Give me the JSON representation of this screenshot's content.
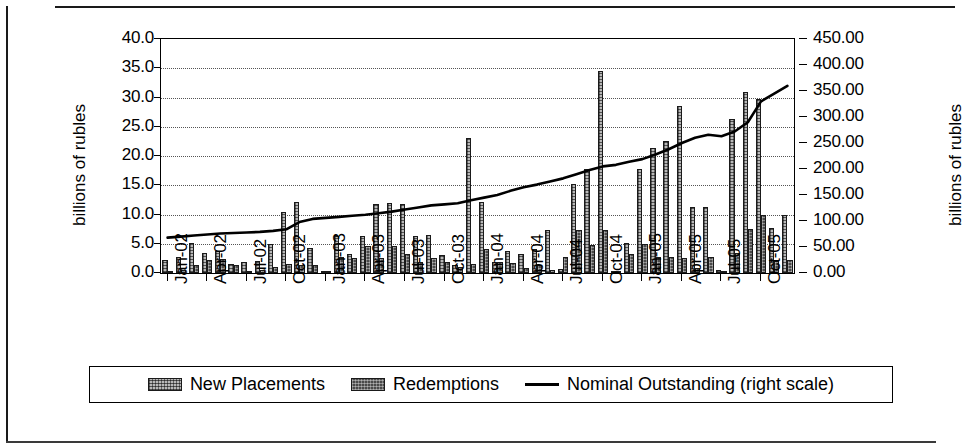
{
  "chart_data": {
    "type": "bar",
    "title": "",
    "subtitle": "",
    "xlabel": "",
    "ylabel": "billions of rubles",
    "ylabel_right": "billions of rubles",
    "ylim": [
      0,
      40
    ],
    "ylim_right": [
      0,
      450
    ],
    "ytick_step": 5,
    "ytick_step_right": 50,
    "grid": true,
    "legend_position": "bottom",
    "y_ticks_left": [
      "0.0",
      "5.0",
      "10.0",
      "15.0",
      "20.0",
      "25.0",
      "30.0",
      "35.0",
      "40.0"
    ],
    "y_ticks_right": [
      "0.00",
      "50.00",
      "100.00",
      "150.00",
      "200.00",
      "250.00",
      "300.00",
      "350.00",
      "400.00",
      "450.00"
    ],
    "x_tick_labels": [
      "Jan-02",
      "Apr-02",
      "Jul-02",
      "Oct-02",
      "Jan-03",
      "Apr-03",
      "Jul-03",
      "Oct-03",
      "Jan-04",
      "Apr-04",
      "Jul-04",
      "Oct-04",
      "Jan-05",
      "Apr-05",
      "Jul-05",
      "Oct-05"
    ],
    "x_tick_indices": [
      0,
      3,
      6,
      9,
      12,
      15,
      18,
      21,
      24,
      27,
      30,
      33,
      36,
      39,
      42,
      45
    ],
    "categories": [
      "Jan-02",
      "Feb-02",
      "Mar-02",
      "Apr-02",
      "May-02",
      "Jun-02",
      "Jul-02",
      "Aug-02",
      "Sep-02",
      "Oct-02",
      "Nov-02",
      "Dec-02",
      "Jan-03",
      "Feb-03",
      "Mar-03",
      "Apr-03",
      "May-03",
      "Jun-03",
      "Jul-03",
      "Aug-03",
      "Sep-03",
      "Oct-03",
      "Nov-03",
      "Dec-03",
      "Jan-04",
      "Feb-04",
      "Mar-04",
      "Apr-04",
      "May-04",
      "Jun-04",
      "Jul-04",
      "Aug-04",
      "Sep-04",
      "Oct-04",
      "Nov-04",
      "Dec-04",
      "Jan-05",
      "Feb-05",
      "Mar-05",
      "Apr-05",
      "May-05",
      "Jun-05",
      "Jul-05",
      "Aug-05",
      "Sep-05",
      "Oct-05",
      "Nov-05",
      "Dec-05"
    ],
    "series": [
      {
        "name": "New Placements",
        "axis": "left",
        "style": "bar-light-hatched",
        "values": [
          2.3,
          2.8,
          5.1,
          3.4,
          3.7,
          1.6,
          1.8,
          2.1,
          5.0,
          10.4,
          12.2,
          4.2,
          0.3,
          6.3,
          3.3,
          6.3,
          11.8,
          12.0,
          11.8,
          6.3,
          6.5,
          3.0,
          1.4,
          23.0,
          12.2,
          1.9,
          3.8,
          3.2,
          4.1,
          7.3,
          0.7,
          15.3,
          17.7,
          34.5,
          0.4,
          5.2,
          17.7,
          21.3,
          22.5,
          28.6,
          11.2,
          11.2,
          0.6,
          26.3,
          31.0,
          29.8,
          7.7,
          10.0
        ]
      },
      {
        "name": "Redemptions",
        "axis": "left",
        "style": "bar-dark-hatched",
        "values": [
          0.4,
          0.5,
          1.4,
          2.2,
          2.4,
          1.4,
          0.4,
          0.5,
          1.0,
          1.5,
          1.3,
          1.4,
          0.2,
          2.8,
          2.5,
          4.6,
          2.6,
          4.6,
          3.2,
          1.9,
          2.6,
          1.8,
          1.1,
          1.6,
          4.1,
          1.8,
          1.7,
          0.9,
          1.4,
          0.5,
          2.7,
          7.3,
          4.8,
          7.3,
          0.2,
          3.2,
          4.9,
          2.8,
          2.7,
          2.5,
          0.8,
          2.7,
          0.3,
          3.5,
          7.6,
          10.0,
          2.0,
          2.2
        ]
      },
      {
        "name": "Nominal Outstanding (right scale)",
        "axis": "right",
        "style": "line",
        "values": [
          68,
          70,
          72,
          74,
          76,
          77,
          78,
          79,
          81,
          84,
          98,
          104,
          106,
          108,
          110,
          112,
          115,
          118,
          122,
          126,
          130,
          132,
          134,
          140,
          145,
          150,
          158,
          165,
          170,
          176,
          182,
          190,
          198,
          205,
          208,
          214,
          219,
          228,
          238,
          250,
          260,
          266,
          263,
          272,
          290,
          330,
          345,
          360
        ]
      }
    ],
    "legend": [
      {
        "label": "New Placements",
        "swatch": "light-hatch-swatch"
      },
      {
        "label": "Redemptions",
        "swatch": "dark-hatch-swatch"
      },
      {
        "label": "Nominal Outstanding (right scale)",
        "swatch": "line-swatch"
      }
    ],
    "colors": {
      "new_placements": "#b9b9b9",
      "redemptions": "#4a4a4a",
      "nominal_outstanding": "#000000",
      "grid": "#555555",
      "axis": "#000000"
    }
  }
}
